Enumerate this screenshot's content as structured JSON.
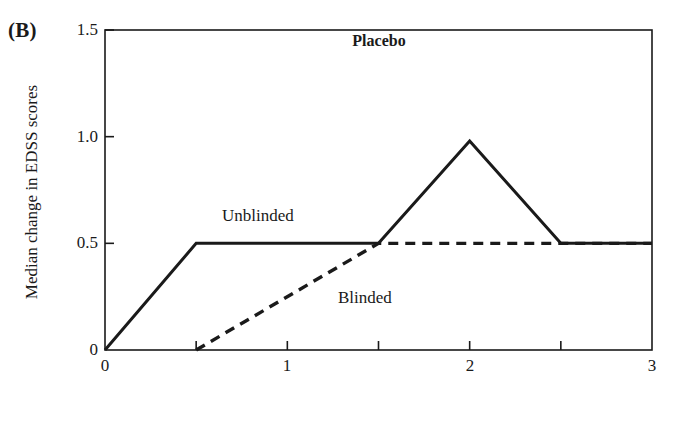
{
  "figure": {
    "panel_letter": "(B)",
    "title": "Placebo",
    "background_color": "#ffffff",
    "ink_color": "#1a1a1a"
  },
  "chart_data": {
    "type": "line",
    "title": "Placebo",
    "xlabel": "Time from randomization, years",
    "ylabel": "Median change in EDSS scores",
    "xlim": [
      0,
      3
    ],
    "ylim": [
      0,
      1.5
    ],
    "xticks": [
      0,
      0.5,
      1,
      1.5,
      2,
      2.5,
      3
    ],
    "xticklabels": [
      "0",
      "",
      "1",
      "",
      "2",
      "",
      "3"
    ],
    "yticks": [
      0,
      0.5,
      1.0,
      1.5
    ],
    "yticklabels": [
      "0",
      "0.5",
      "1.0",
      "1.5"
    ],
    "grid": false,
    "legend": "inline-annotations",
    "series": [
      {
        "name": "Unblinded",
        "style": "solid",
        "color": "#1a1a1a",
        "label_position": {
          "x": 0.65,
          "y": 0.58
        },
        "x": [
          0,
          0.5,
          1.5,
          2,
          2.5,
          3
        ],
        "y": [
          0,
          0.5,
          0.5,
          0.98,
          0.5,
          0.5
        ]
      },
      {
        "name": "Blinded",
        "style": "dashed",
        "color": "#1a1a1a",
        "label_position": {
          "x": 1.3,
          "y": 0.22
        },
        "x": [
          0.5,
          1.5,
          3
        ],
        "y": [
          0,
          0.5,
          0.5
        ]
      }
    ]
  },
  "axis_labels": {
    "y": [
      "1.5",
      "1.0",
      "0.5",
      "0"
    ],
    "x": [
      "0",
      "1",
      "2",
      "3"
    ]
  },
  "series_labels": {
    "unblinded": "Unblinded",
    "blinded": "Blinded"
  }
}
